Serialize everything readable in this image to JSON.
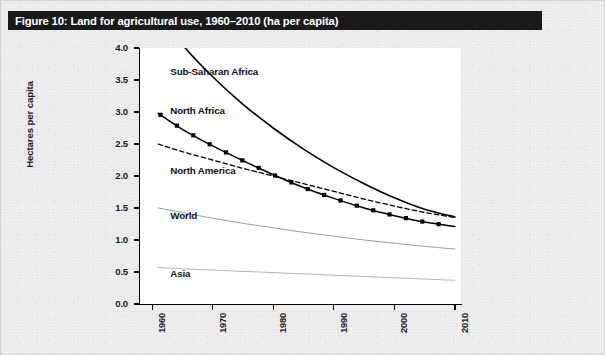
{
  "figure": {
    "title": "Figure 10: Land for agricultural use, 1960–2010 (ha per capita)"
  },
  "chart_data": {
    "type": "line",
    "title": "Figure 10: Land for agricultural use, 1960–2010 (ha per capita)",
    "xlabel": "",
    "ylabel": "Hectares per capita",
    "xlim": [
      1958,
      2011
    ],
    "ylim": [
      0.0,
      4.0
    ],
    "grid": false,
    "legend_position": "inline-labels",
    "x_ticks": [
      "1960",
      "1970",
      "1980",
      "1990",
      "2000",
      "2010"
    ],
    "x_tick_values": [
      1960,
      1970,
      1980,
      1990,
      2000,
      2010
    ],
    "y_ticks": [
      "0.0",
      "0.5",
      "1.0",
      "1.5",
      "2.0",
      "2.5",
      "3.0",
      "3.5",
      "4.0"
    ],
    "y_tick_values": [
      0.0,
      0.5,
      1.0,
      1.5,
      2.0,
      2.5,
      3.0,
      3.5,
      4.0
    ],
    "x": [
      1961,
      1965,
      1970,
      1975,
      1980,
      1985,
      1990,
      1995,
      2000,
      2005,
      2010
    ],
    "series": [
      {
        "name": "Sub-Saharan Africa",
        "style": "solid",
        "color": "#000000",
        "width": 1.6,
        "marker": "none",
        "label_x": 1963,
        "label_y": 3.62,
        "values": [
          4.55,
          4.05,
          3.55,
          3.12,
          2.75,
          2.42,
          2.13,
          1.88,
          1.66,
          1.48,
          1.36
        ]
      },
      {
        "name": "North Africa",
        "style": "solid",
        "color": "#000000",
        "width": 1.5,
        "marker": "square",
        "label_x": 1963,
        "label_y": 3.02,
        "values": [
          2.98,
          2.73,
          2.47,
          2.24,
          2.02,
          1.82,
          1.65,
          1.5,
          1.38,
          1.28,
          1.21
        ]
      },
      {
        "name": "North America",
        "style": "dashed",
        "color": "#000000",
        "width": 1.3,
        "marker": "none",
        "label_x": 1963,
        "label_y": 2.08,
        "values": [
          2.5,
          2.38,
          2.25,
          2.12,
          2.0,
          1.88,
          1.76,
          1.64,
          1.53,
          1.43,
          1.35
        ]
      },
      {
        "name": "World",
        "style": "solid",
        "color": "#9a9a9a",
        "width": 1.0,
        "marker": "none",
        "label_x": 1963,
        "label_y": 1.38,
        "values": [
          1.5,
          1.43,
          1.34,
          1.26,
          1.19,
          1.12,
          1.06,
          1.0,
          0.95,
          0.9,
          0.86
        ]
      },
      {
        "name": "Asia",
        "style": "solid",
        "color": "#b5b5b5",
        "width": 1.0,
        "marker": "none",
        "label_x": 1963,
        "label_y": 0.47,
        "values": [
          0.57,
          0.55,
          0.53,
          0.51,
          0.49,
          0.47,
          0.45,
          0.43,
          0.41,
          0.39,
          0.37
        ]
      }
    ]
  }
}
